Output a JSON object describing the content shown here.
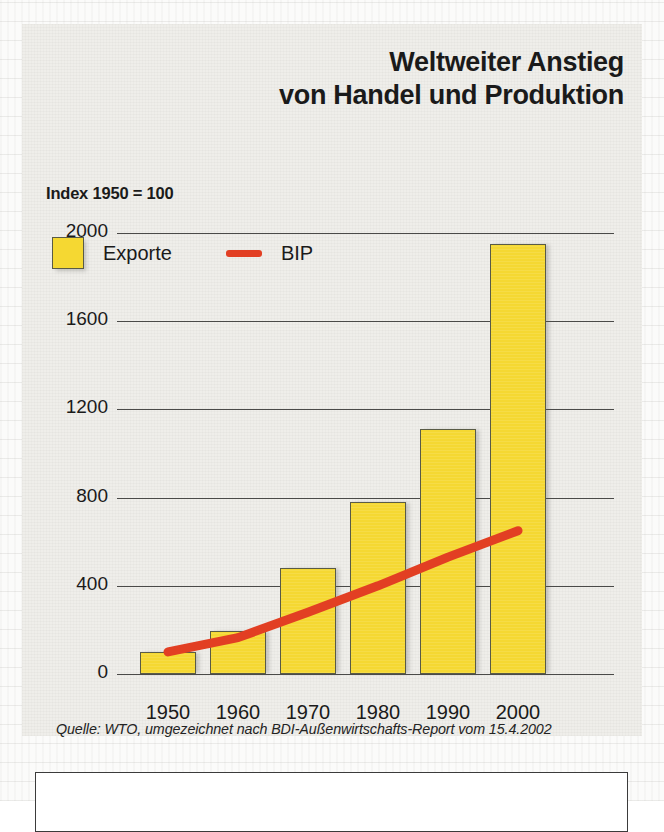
{
  "figure": {
    "title_line1": "Weltweiter Anstieg",
    "title_line2": "von Handel und Produktion",
    "index_note": "Index 1950 = 100",
    "source": "Quelle: WTO, umgezeichnet nach BDI-Außenwirtschafts-Report vom 15.4.2002"
  },
  "legend": {
    "exports_label": "Exporte",
    "gdp_label": "BIP"
  },
  "colors": {
    "bar_fill": "#f5d832",
    "bar_stroke": "#595b46",
    "line": "#e23f23",
    "panel": "#efeeea",
    "grid": "#4a4a48",
    "text": "#1a1a1a"
  },
  "chart_data": {
    "type": "bar",
    "title": "Weltweiter Anstieg von Handel und Produktion",
    "subtitle": "Index 1950 = 100",
    "xlabel": "",
    "ylabel": "Index 1950 = 100",
    "categories": [
      "1950",
      "1960",
      "1970",
      "1980",
      "1990",
      "2000"
    ],
    "ylim": [
      0,
      2000
    ],
    "yticks": [
      0,
      400,
      800,
      1200,
      1600,
      2000
    ],
    "ytick_labels": [
      "0",
      "400",
      "800",
      "1200",
      "1600",
      "2000"
    ],
    "grid": true,
    "legend_position": "top-left",
    "series": [
      {
        "name": "Exporte",
        "type": "bar",
        "color": "#f5d832",
        "values": [
          100,
          195,
          480,
          780,
          1110,
          1950
        ]
      },
      {
        "name": "BIP",
        "type": "line",
        "color": "#e23f23",
        "values": [
          100,
          165,
          280,
          400,
          530,
          650
        ]
      }
    ],
    "annotations": [
      "Quelle: WTO, umgezeichnet nach BDI-Außenwirtschafts-Report vom 15.4.2002"
    ]
  }
}
